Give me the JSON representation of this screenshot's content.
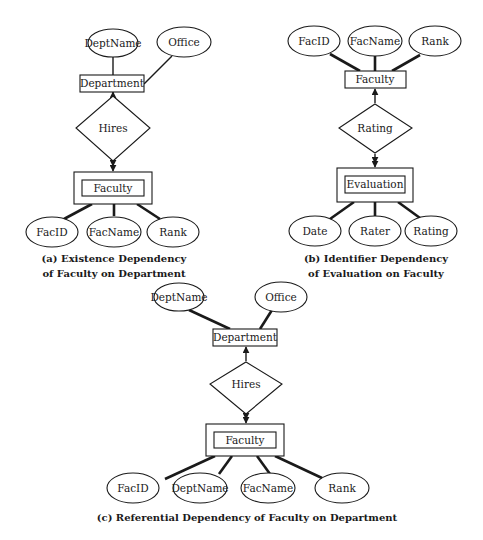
{
  "figure": {
    "panels": [
      {
        "id": "a",
        "caption_line1": "(a) Existence Dependency",
        "caption_line2": "of Faculty on Department",
        "parent_entity": "Department",
        "parent_attributes": [
          "DeptName",
          "Office"
        ],
        "relationship": "Hires",
        "weak_entity": "Faculty",
        "weak_attributes": [
          "FacID",
          "FacName",
          "Rank"
        ]
      },
      {
        "id": "b",
        "caption_line1": "(b) Identifier Dependency",
        "caption_line2": "of Evaluation on Faculty",
        "parent_entity": "Faculty",
        "parent_attributes": [
          "FacID",
          "FacName",
          "Rank"
        ],
        "relationship": "Rating",
        "weak_entity": "Evaluation",
        "weak_attributes": [
          "Date",
          "Rater",
          "Rating"
        ]
      },
      {
        "id": "c",
        "caption_line1": "(c) Referential Dependency of Faculty on Department",
        "parent_entity": "Department",
        "parent_attributes": [
          "DeptName",
          "Office"
        ],
        "relationship": "Hires",
        "weak_entity": "Faculty",
        "weak_attributes": [
          "FacID",
          "DeptName",
          "FacName",
          "Rank"
        ]
      }
    ]
  }
}
